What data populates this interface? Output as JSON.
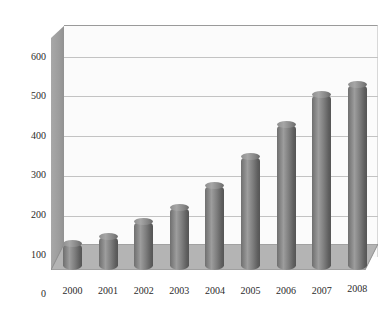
{
  "chart_data": {
    "type": "bar",
    "title": "",
    "subtitle": "",
    "xlabel": "",
    "ylabel": "",
    "categories": [
      "2000",
      "2001",
      "2002",
      "2003",
      "2004",
      "2005",
      "2006",
      "2007",
      "2008"
    ],
    "values": [
      75,
      95,
      137,
      178,
      240,
      320,
      412,
      497,
      525
    ],
    "series": [
      {
        "name": "Series 1",
        "values": [
          75,
          95,
          137,
          178,
          240,
          320,
          412,
          497,
          525
        ]
      }
    ],
    "ylim": [
      0,
      600
    ],
    "ytick_labels": [
      "0",
      "100",
      "200",
      "300",
      "400",
      "500",
      "600"
    ],
    "ytick_values": [
      0,
      100,
      200,
      300,
      400,
      500,
      600
    ],
    "xtick_labels": [
      "2000",
      "2001",
      "2002",
      "2003",
      "2004",
      "2005",
      "2006",
      "2007",
      "2008"
    ],
    "grid": true,
    "grid_axis": "y",
    "legend": false,
    "legend_position": "none",
    "style": "3d-cylinder",
    "annotations": [],
    "colors": {
      "bar_light": "#9d9d9d",
      "bar_mid": "#7e7e7e",
      "bar_dark": "#555555",
      "floor": "#b4b4b4",
      "left_wall": "#9d9d9d",
      "back_wall": "#fbfbfb",
      "gridline": "#c3c3c3",
      "text": "#2b2b2b",
      "background": "#ffffff"
    }
  }
}
